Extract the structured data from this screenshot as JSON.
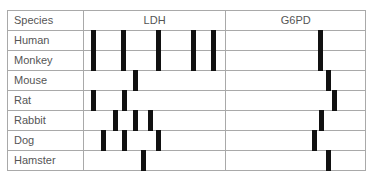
{
  "table": {
    "headers": [
      "Species",
      "LDH",
      "G6PD"
    ],
    "bar_color": "#111111",
    "grid_color": "#a9a9a9",
    "text_color": "#555555",
    "rows": [
      {
        "species": "Human",
        "ldh_bands_px": [
          7,
          37.5,
          72,
          107,
          127
        ],
        "g6pd_bands_px": [
          92
        ]
      },
      {
        "species": "Monkey",
        "ldh_bands_px": [
          7,
          37.5,
          72,
          107,
          127
        ],
        "g6pd_bands_px": [
          92
        ]
      },
      {
        "species": "Mouse",
        "ldh_bands_px": [
          49
        ],
        "g6pd_bands_px": [
          99.5
        ]
      },
      {
        "species": "Rat",
        "ldh_bands_px": [
          7,
          38.5
        ],
        "g6pd_bands_px": [
          106
        ]
      },
      {
        "species": "Rabbit",
        "ldh_bands_px": [
          29,
          49.5,
          64
        ],
        "g6pd_bands_px": [
          93
        ]
      },
      {
        "species": "Dog",
        "ldh_bands_px": [
          17,
          38.5,
          72
        ],
        "g6pd_bands_px": [
          85.5
        ]
      },
      {
        "species": "Hamster",
        "ldh_bands_px": [
          57
        ],
        "g6pd_bands_px": [
          99.5
        ]
      }
    ]
  }
}
